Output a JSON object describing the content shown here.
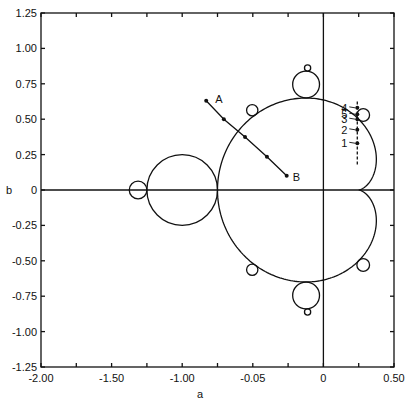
{
  "chart_data": {
    "type": "scatter",
    "title": "",
    "xlabel": "a",
    "ylabel": "b",
    "xlim": [
      -2.0,
      0.5
    ],
    "ylim": [
      -1.25,
      1.25
    ],
    "grid": false,
    "legend": null,
    "x_ticks": [
      -2.0,
      -1.75,
      -1.5,
      -1.25,
      -1.0,
      -0.75,
      -0.5,
      -0.25,
      0,
      0.25,
      0.5
    ],
    "x_tick_labels": [
      {
        "value": -2.0,
        "label": "-2.00"
      },
      {
        "value": -1.5,
        "label": "-1.50"
      },
      {
        "value": -1.0,
        "label": "-1.00"
      },
      {
        "value": -0.5,
        "label": "-0.05"
      },
      {
        "value": 0,
        "label": "0"
      },
      {
        "value": 0.5,
        "label": "0.50"
      }
    ],
    "y_ticks": [
      -1.25,
      -1.0,
      -0.75,
      -0.5,
      -0.25,
      0,
      0.25,
      0.5,
      0.75,
      1.0,
      1.25
    ],
    "y_tick_labels": [
      {
        "value": 1.25,
        "label": "1.25"
      },
      {
        "value": 1.0,
        "label": "1.00"
      },
      {
        "value": 0.75,
        "label": "0.75"
      },
      {
        "value": 0.5,
        "label": "0.50"
      },
      {
        "value": 0.25,
        "label": "0.25"
      },
      {
        "value": 0,
        "label": "0"
      },
      {
        "value": -0.25,
        "label": "-0.25"
      },
      {
        "value": -0.5,
        "label": "-0.50"
      },
      {
        "value": -0.75,
        "label": "-0.75"
      },
      {
        "value": -1.0,
        "label": "-1.00"
      },
      {
        "value": -1.25,
        "label": "-1.25"
      }
    ],
    "cardioid": {
      "description": "main cardioid of Mandelbrot set",
      "cusp": [
        0.25,
        0
      ]
    },
    "circles": [
      {
        "name": "period-2 bulb",
        "cx": -1.0,
        "cy": 0,
        "r": 0.25
      },
      {
        "name": "period-4 bulb",
        "cx": -1.3125,
        "cy": 0,
        "r": 0.0625
      },
      {
        "name": "period-3 bulb top",
        "cx": -0.1226,
        "cy": 0.7449,
        "r": 0.095
      },
      {
        "name": "period-3 bulb bottom",
        "cx": -0.1226,
        "cy": -0.7449,
        "r": 0.095
      },
      {
        "name": "period-6 bulb top",
        "cx": -0.112,
        "cy": 0.862,
        "r": 0.022
      },
      {
        "name": "period-6 bulb bottom",
        "cx": -0.112,
        "cy": -0.862,
        "r": 0.022
      },
      {
        "name": "period-5 bulb top-left",
        "cx": -0.504,
        "cy": 0.563,
        "r": 0.04
      },
      {
        "name": "period-5 bulb bottom-left",
        "cx": -0.504,
        "cy": -0.563,
        "r": 0.04
      },
      {
        "name": "period-4 bulb top-right",
        "cx": 0.282,
        "cy": 0.53,
        "r": 0.045
      },
      {
        "name": "period-4 bulb bottom-right",
        "cx": 0.282,
        "cy": -0.53,
        "r": 0.045
      }
    ],
    "path_AB": {
      "points": [
        [
          -0.83,
          0.63
        ],
        [
          -0.705,
          0.5
        ],
        [
          -0.555,
          0.375
        ],
        [
          -0.4,
          0.235
        ],
        [
          -0.26,
          0.1
        ]
      ],
      "labels": {
        "start": "A",
        "end": "B"
      }
    },
    "path_numbered": {
      "x": 0.24,
      "y_range": [
        0.18,
        0.64
      ],
      "dashed": true,
      "points": [
        {
          "label": "1",
          "x": 0.24,
          "y": 0.33
        },
        {
          "label": "2",
          "x": 0.24,
          "y": 0.425
        },
        {
          "label": "3",
          "x": 0.24,
          "y": 0.5
        },
        {
          "label": "5",
          "x": 0.24,
          "y": 0.535
        },
        {
          "label": "4",
          "x": 0.24,
          "y": 0.58
        }
      ]
    }
  }
}
